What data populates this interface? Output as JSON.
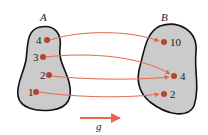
{
  "diagram": {
    "type": "function-mapping",
    "colors": {
      "set_fill": "#cbcbcb",
      "set_stroke": "#111111",
      "point": "#b5452c",
      "arrow": "#e5684c"
    },
    "domain": {
      "label": "A",
      "points": [
        {
          "label": "4",
          "x": 47,
          "y": 40
        },
        {
          "label": "3",
          "x": 43,
          "y": 57
        },
        {
          "label": "2",
          "x": 49,
          "y": 75
        },
        {
          "label": "1",
          "x": 36,
          "y": 92
        }
      ]
    },
    "codomain": {
      "label": "B",
      "points": [
        {
          "label": "10",
          "x": 164,
          "y": 42
        },
        {
          "label": "4",
          "x": 174,
          "y": 76
        },
        {
          "label": "2",
          "x": 164,
          "y": 94
        }
      ]
    },
    "mappings": [
      {
        "from": "4",
        "to": "10"
      },
      {
        "from": "3",
        "to": "4"
      },
      {
        "from": "2",
        "to": "4"
      },
      {
        "from": "1",
        "to": "2"
      }
    ],
    "function_label": "g"
  }
}
